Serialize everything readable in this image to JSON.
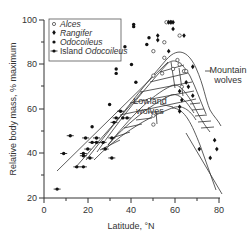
{
  "chart_data": {
    "type": "scatter",
    "title": "",
    "xlabel": "Latitude, °N",
    "ylabel": "Relative body mass, % maximum",
    "xlim": [
      0,
      80
    ],
    "ylim": [
      20,
      100
    ],
    "x_ticks": [
      0,
      20,
      40,
      60,
      80
    ],
    "y_ticks": [
      20,
      40,
      60,
      80,
      100
    ],
    "grid": false,
    "legend_position": "upper-left",
    "legend": [
      "Alces",
      "Rangifer",
      "Odocoileus",
      "Island Odocoileus"
    ],
    "series": [
      {
        "name": "Alces",
        "marker": "open-circle",
        "points": [
          [
            56,
            99
          ],
          [
            58,
            99
          ],
          [
            50,
            86
          ],
          [
            55,
            90
          ],
          [
            62,
            93
          ],
          [
            55,
            83
          ],
          [
            61,
            82
          ],
          [
            59,
            78
          ],
          [
            64,
            77
          ],
          [
            50,
            75
          ],
          [
            54,
            76
          ],
          [
            63,
            70
          ],
          [
            48,
            64
          ],
          [
            50,
            57
          ],
          [
            50,
            53
          ],
          [
            62,
            80
          ],
          [
            65,
            77
          ]
        ]
      },
      {
        "name": "Rangifer",
        "marker": "diamond",
        "points": [
          [
            57,
            99
          ],
          [
            58,
            99
          ],
          [
            59,
            99
          ],
          [
            59,
            96
          ],
          [
            52,
            93
          ],
          [
            52,
            91
          ],
          [
            64,
            93
          ],
          [
            57,
            86
          ],
          [
            68,
            79
          ],
          [
            65,
            72
          ],
          [
            66,
            70
          ],
          [
            68,
            66
          ],
          [
            62,
            68
          ],
          [
            63,
            64
          ],
          [
            62,
            61
          ],
          [
            62,
            59
          ],
          [
            78,
            46
          ],
          [
            79,
            42
          ],
          [
            76,
            38
          ],
          [
            71,
            42
          ]
        ]
      },
      {
        "name": "Odocoileus",
        "marker": "filled-circle",
        "points": [
          [
            41,
            98
          ],
          [
            41,
            97
          ],
          [
            48,
            92
          ],
          [
            33,
            78
          ],
          [
            33,
            76
          ],
          [
            40,
            80
          ],
          [
            42,
            72
          ],
          [
            37,
            88
          ],
          [
            30,
            62
          ],
          [
            22,
            52
          ],
          [
            36,
            56
          ],
          [
            47,
            89
          ]
        ]
      },
      {
        "name": "Island Odocoileus",
        "marker": "filled-circle-with-bar",
        "points": [
          [
            6,
            24
          ],
          [
            9,
            40
          ],
          [
            12,
            48
          ],
          [
            15,
            34
          ],
          [
            18,
            34
          ],
          [
            18,
            40
          ],
          [
            18,
            39
          ],
          [
            19,
            47
          ],
          [
            20,
            42
          ],
          [
            21,
            38
          ],
          [
            22,
            45
          ],
          [
            24,
            47
          ],
          [
            24,
            45
          ],
          [
            27,
            45
          ],
          [
            28,
            42
          ],
          [
            31,
            47
          ],
          [
            31,
            38
          ],
          [
            32,
            54
          ],
          [
            33,
            56
          ],
          [
            35,
            59
          ],
          [
            38,
            56
          ]
        ]
      }
    ],
    "annotations": [
      {
        "text": "Mountain wolves",
        "x": 74,
        "y": 68
      },
      {
        "text": "Lowland wolves",
        "x": 50,
        "y": 55
      }
    ],
    "regions": [
      {
        "name": "Mountain wolves band",
        "style": "horizontal-hatch"
      },
      {
        "name": "Lowland wolves band",
        "style": "diagonal-hatch"
      }
    ],
    "trend_lines": [
      {
        "name": "rising envelope",
        "from": [
          6,
          32
        ],
        "to": [
          57,
          88
        ]
      },
      {
        "name": "declining envelope",
        "from": [
          58,
          78
        ],
        "to": [
          80,
          45
        ]
      }
    ]
  },
  "labels": {
    "xlabel": "Latitude, °N",
    "ylabel": "Relative body mass, % maximum",
    "mountain_1": "Mountain",
    "mountain_2": "wolves",
    "lowland_1": "Lowland",
    "lowland_2": "wolves",
    "legend": [
      "Alces",
      "Rangifer",
      "Odocoileus",
      "Island ",
      "Odocoileus"
    ],
    "xticks": [
      "0",
      "20",
      "40",
      "60",
      "80"
    ],
    "yticks": [
      "20",
      "40",
      "60",
      "80",
      "100"
    ]
  }
}
